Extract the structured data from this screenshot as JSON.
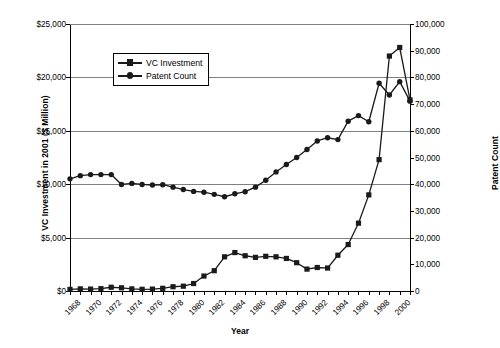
{
  "chart_data": {
    "type": "line",
    "title": "",
    "xlabel": "Year",
    "ylabel": "VC Investment in 2001 ($ Million)",
    "y2label": "Patent Count",
    "grid": true,
    "legend_position": "upper-left-inside",
    "xlim": [
      1968,
      2001
    ],
    "ylim": [
      0,
      25000
    ],
    "y2lim": [
      0,
      100000
    ],
    "xticks": [
      "1968",
      "1970",
      "1972",
      "1974",
      "1976",
      "1978",
      "1980",
      "1982",
      "1984",
      "1986",
      "1988",
      "1990",
      "1992",
      "1994",
      "1996",
      "1998",
      "2000"
    ],
    "yticks_left": [
      "$0",
      "$5,000",
      "$10,000",
      "$15,000",
      "$20,000",
      "$25,000"
    ],
    "yticks_right": [
      "0",
      "10,000",
      "20,000",
      "30,000",
      "40,000",
      "50,000",
      "60,000",
      "70,000",
      "80,000",
      "90,000",
      "100,000"
    ],
    "x": [
      1968,
      1969,
      1970,
      1971,
      1972,
      1973,
      1974,
      1975,
      1976,
      1977,
      1978,
      1979,
      1980,
      1981,
      1982,
      1983,
      1984,
      1985,
      1986,
      1987,
      1988,
      1989,
      1990,
      1991,
      1992,
      1993,
      1994,
      1995,
      1996,
      1997,
      1998,
      1999,
      2000,
      2001
    ],
    "series": [
      {
        "name": "VC Investment",
        "axis": "left",
        "marker": "square",
        "color": "#1a1a1a",
        "values": [
          150,
          200,
          180,
          220,
          350,
          300,
          200,
          160,
          180,
          250,
          400,
          450,
          700,
          1400,
          1900,
          3200,
          3600,
          3300,
          3150,
          3250,
          3200,
          3050,
          2650,
          2050,
          2200,
          2150,
          3350,
          4350,
          6350,
          9000,
          12300,
          22000,
          22800,
          17900
        ]
      },
      {
        "name": "Patent Count",
        "axis": "right",
        "marker": "circle",
        "color": "#1a1a1a",
        "values": [
          42000,
          43200,
          43600,
          43600,
          43600,
          39900,
          40300,
          39900,
          39700,
          39800,
          38900,
          38000,
          37300,
          37000,
          36200,
          35300,
          36400,
          37200,
          38900,
          41500,
          44600,
          47400,
          50000,
          53000,
          56200,
          57400,
          56700,
          63600,
          65700,
          63400,
          77800,
          73400,
          78400,
          71100
        ]
      }
    ],
    "notes": {
      "vc_units": "$ Million (2001 dollars)",
      "patent_units": "count"
    }
  },
  "legend": {
    "items": [
      {
        "label": "VC Investment",
        "marker": "square"
      },
      {
        "label": "Patent Count",
        "marker": "circle"
      }
    ]
  }
}
